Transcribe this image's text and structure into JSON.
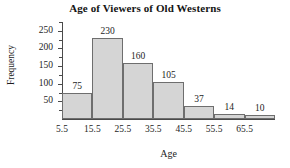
{
  "chart_data": {
    "type": "bar",
    "title": "Age of Viewers of Old Westerns",
    "xlabel": "Age",
    "ylabel": "Frequency",
    "categories": [
      "5.5-15.5",
      "15.5-25.5",
      "25.5-35.5",
      "35.5-45.5",
      "45.5-55.5",
      "55.5-65.5",
      "65.5-75.5"
    ],
    "values": [
      75,
      230,
      160,
      105,
      37,
      14,
      10
    ],
    "bar_labels": [
      "75",
      "230",
      "160",
      "105",
      "37",
      "14",
      "10"
    ],
    "bin_edges": [
      5.5,
      15.5,
      25.5,
      35.5,
      45.5,
      55.5,
      65.5,
      75.5
    ],
    "x_tick_labels": [
      "5.5",
      "15.5",
      "25.5",
      "35.5",
      "45.5",
      "55.5",
      "65.5"
    ],
    "x_tick_values": [
      5.5,
      15.5,
      25.5,
      35.5,
      45.5,
      55.5,
      65.5
    ],
    "y_tick_labels": [
      "50",
      "100",
      "150",
      "200",
      "250"
    ],
    "y_tick_values": [
      50,
      100,
      150,
      200,
      250
    ],
    "y_minor_tick_values": [
      25,
      75,
      125,
      175,
      225,
      275
    ],
    "ylim": [
      0,
      275
    ],
    "xlim": [
      5.5,
      75.5
    ],
    "grid": false,
    "legend": false,
    "bar_fill_color": "#d5d5d5",
    "bar_border_color": "#6e6e6e",
    "axis_color": "#4a4a4a",
    "background_color": "#ffffff"
  }
}
